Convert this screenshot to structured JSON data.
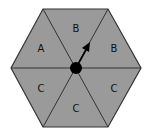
{
  "diagram": {
    "type": "spinner",
    "shape": "hexagon",
    "fill_color": "#9a9a9a",
    "line_color": "#333333",
    "sections": [
      {
        "position": "top",
        "label": "B"
      },
      {
        "position": "upper-right",
        "label": "B"
      },
      {
        "position": "lower-right",
        "label": "C"
      },
      {
        "position": "bottom",
        "label": "C"
      },
      {
        "position": "lower-left",
        "label": "C"
      },
      {
        "position": "upper-left",
        "label": "A"
      }
    ],
    "pointer": {
      "direction": "upper-right",
      "color": "#000000"
    }
  }
}
